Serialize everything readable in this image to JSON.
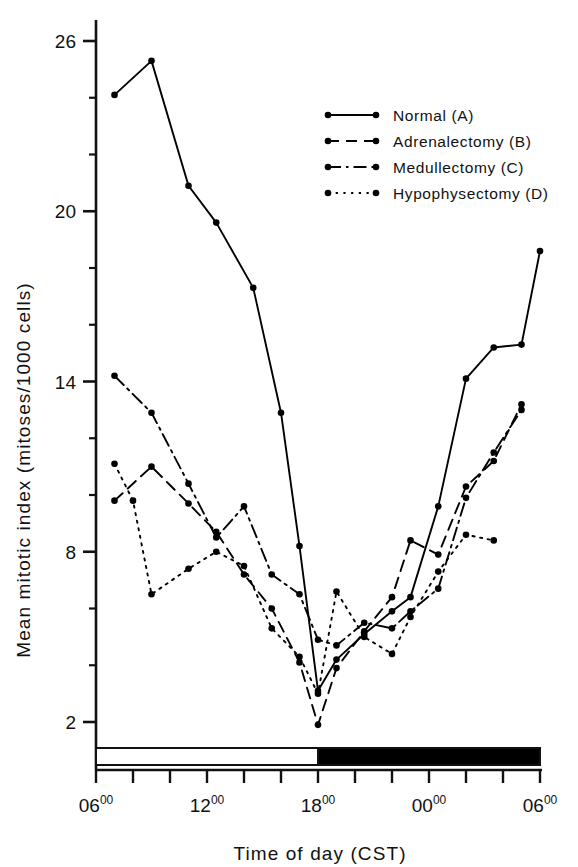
{
  "chart_data": {
    "type": "line",
    "title": "",
    "xlabel": "Time of day (CST)",
    "ylabel": "Mean mitotic index (mitoses/1000 cells)",
    "xlim": [
      6,
      30
    ],
    "ylim": [
      0.6,
      27.4
    ],
    "yticks": [
      2,
      8,
      14,
      20,
      26
    ],
    "yticklabels": [
      "2",
      "8",
      "14",
      "20",
      "26"
    ],
    "yminorticks": [
      4,
      6,
      10,
      12,
      16,
      18,
      22,
      24
    ],
    "xticks": [
      6,
      8,
      10,
      12,
      14,
      16,
      18,
      20,
      22,
      24,
      26,
      28,
      30
    ],
    "xticklabels": [
      {
        "at": 6,
        "main": "06",
        "sup": "00"
      },
      {
        "at": 12,
        "main": "12",
        "sup": "00"
      },
      {
        "at": 18,
        "main": "18",
        "sup": "00"
      },
      {
        "at": 24,
        "main": "00",
        "sup": "00"
      },
      {
        "at": 30,
        "main": "06",
        "sup": "00"
      }
    ],
    "grid": false,
    "legend_position": "upper right",
    "photoperiod": {
      "light_label": "light",
      "dark_label": "dark",
      "light_span": [
        6,
        18
      ],
      "dark_span": [
        18,
        30
      ],
      "light_color": "#ffffff",
      "dark_color": "#000000"
    },
    "series": [
      {
        "name": "Normal (A)",
        "key": "A",
        "style": "solid",
        "color": "#000000",
        "x": [
          7,
          9,
          11,
          12.5,
          14.5,
          16,
          17,
          18,
          19,
          20.5,
          22,
          23,
          24.5,
          26,
          27.5,
          29,
          30
        ],
        "y": [
          24.1,
          25.3,
          20.9,
          19.6,
          17.3,
          12.9,
          8.2,
          3.1,
          4.2,
          5.1,
          5.9,
          6.4,
          9.6,
          14.1,
          15.2,
          15.3,
          18.6
        ]
      },
      {
        "name": "Adrenalectomy (B)",
        "key": "B",
        "style": "dashed",
        "color": "#000000",
        "x": [
          7,
          9,
          11,
          12.5,
          14,
          15.5,
          17,
          18,
          19,
          20.5,
          22,
          23,
          24.5,
          26,
          27.5,
          29
        ],
        "y": [
          9.8,
          11.0,
          9.7,
          8.7,
          7.2,
          6.0,
          4.1,
          1.9,
          3.9,
          5.2,
          6.4,
          8.4,
          7.9,
          10.3,
          11.2,
          13.2
        ]
      },
      {
        "name": "Medullectomy (C)",
        "key": "C",
        "style": "dashdot",
        "color": "#000000",
        "x": [
          7,
          9,
          11,
          12.5,
          14,
          15.5,
          17,
          18,
          19,
          20.5,
          22,
          23,
          24.5,
          26,
          27.5,
          29
        ],
        "y": [
          14.2,
          12.9,
          10.4,
          8.5,
          9.6,
          7.2,
          6.5,
          4.9,
          4.7,
          5.5,
          5.3,
          5.9,
          6.7,
          9.9,
          11.5,
          13.0
        ]
      },
      {
        "name": "Hypophysectomy (D)",
        "key": "D",
        "style": "dotted",
        "color": "#000000",
        "x": [
          7,
          8,
          9,
          11,
          12.5,
          14,
          15.5,
          17,
          18,
          19,
          20.5,
          22,
          23,
          24.5,
          26,
          27.5
        ],
        "y": [
          11.1,
          9.8,
          6.5,
          7.4,
          8.0,
          7.5,
          5.3,
          4.3,
          3.0,
          6.6,
          5.0,
          4.4,
          5.7,
          7.3,
          8.6,
          8.4
        ]
      }
    ],
    "legend": [
      {
        "label": "Normal (A)",
        "style": "solid"
      },
      {
        "label": "Adrenalectomy (B)",
        "style": "dashed"
      },
      {
        "label": "Medullectomy (C)",
        "style": "dashdot"
      },
      {
        "label": "Hypophysectomy (D)",
        "style": "dotted"
      }
    ]
  }
}
